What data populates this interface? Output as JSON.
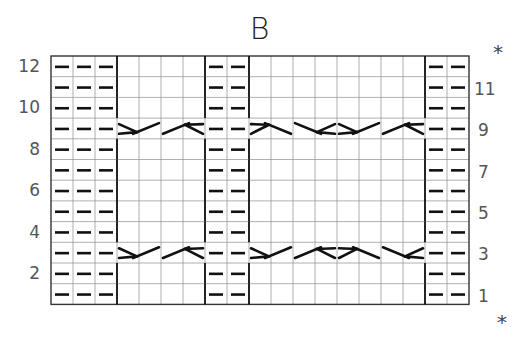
{
  "title": "B",
  "chart": {
    "columns": 19,
    "rows": 12,
    "column_groups": [
      {
        "type": "purl",
        "start": 1,
        "count": 3
      },
      {
        "type": "cable",
        "start": 4,
        "count": 4
      },
      {
        "type": "purl",
        "start": 8,
        "count": 2
      },
      {
        "type": "cable",
        "start": 10,
        "count": 8
      },
      {
        "type": "purl",
        "start": 18,
        "count": 2
      }
    ],
    "purl_symbol": "—",
    "cable_rows": [
      3,
      9
    ],
    "cables": {
      "row_9": [
        {
          "cols": [
            4,
            5
          ],
          "dir": "right"
        },
        {
          "cols": [
            6,
            7
          ],
          "dir": "left"
        },
        {
          "cols": [
            10,
            11
          ],
          "dir": "right-down"
        },
        {
          "cols": [
            12,
            13
          ],
          "dir": "left-down"
        },
        {
          "cols": [
            14,
            15
          ],
          "dir": "right"
        },
        {
          "cols": [
            16,
            17
          ],
          "dir": "left"
        }
      ],
      "row_3": [
        {
          "cols": [
            4,
            5
          ],
          "dir": "right"
        },
        {
          "cols": [
            6,
            7
          ],
          "dir": "left"
        },
        {
          "cols": [
            10,
            11
          ],
          "dir": "right"
        },
        {
          "cols": [
            12,
            13
          ],
          "dir": "left"
        },
        {
          "cols": [
            14,
            15
          ],
          "dir": "right-down"
        },
        {
          "cols": [
            16,
            17
          ],
          "dir": "left-down"
        }
      ]
    }
  },
  "labels": {
    "left": [
      "12",
      "10",
      "8",
      "6",
      "4",
      "2"
    ],
    "right": [
      "11",
      "9",
      "7",
      "5",
      "3",
      "1"
    ],
    "repeat_marker": "*"
  }
}
